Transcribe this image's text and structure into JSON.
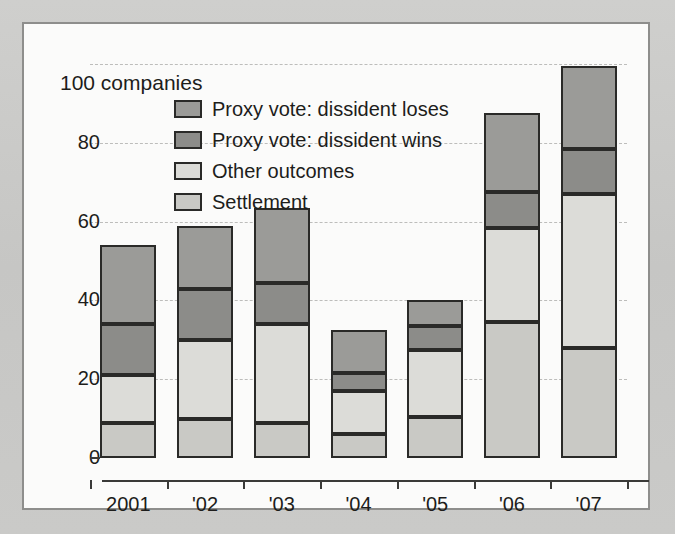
{
  "chart_data": {
    "type": "bar",
    "stacked": true,
    "title": "",
    "subtitle": "",
    "unit_label": "100 companies",
    "xlabel": "",
    "ylabel": "",
    "ylim": [
      0,
      100
    ],
    "yticks": [
      0,
      20,
      40,
      60,
      80,
      100
    ],
    "ytick_labels": [
      "0",
      "20",
      "40",
      "60",
      "80",
      "100"
    ],
    "grid": true,
    "legend_position": "top-center",
    "categories": [
      "2001",
      "'02",
      "'03",
      "'04",
      "'05",
      "'06",
      "'07"
    ],
    "series": [
      {
        "name": "Settlement",
        "color": "#c9c9c5",
        "values": [
          9,
          10,
          9,
          6,
          10.5,
          34.5,
          28
        ]
      },
      {
        "name": "Other outcomes",
        "color": "#dcdcd8",
        "values": [
          12,
          20,
          25,
          11,
          17,
          24,
          39
        ]
      },
      {
        "name": "Proxy vote: dissident wins",
        "color": "#8c8c89",
        "values": [
          13,
          13,
          10.5,
          4.5,
          6,
          9,
          11.5
        ]
      },
      {
        "name": "Proxy vote: dissident loses",
        "color": "#9b9b98",
        "values": [
          20,
          16,
          19,
          11,
          6.5,
          20,
          21
        ]
      }
    ],
    "totals": [
      54,
      59,
      64,
      32,
      40,
      88,
      100
    ],
    "legend_order": [
      "Proxy vote: dissident loses",
      "Proxy vote: dissident wins",
      "Other outcomes",
      "Settlement"
    ]
  },
  "legend": {
    "items": [
      {
        "label": "Proxy vote: dissident loses",
        "swatch_class": "fill-loses",
        "color": "#9b9b98"
      },
      {
        "label": "Proxy vote: dissident wins",
        "swatch_class": "fill-wins",
        "color": "#8c8c89"
      },
      {
        "label": "Other outcomes",
        "swatch_class": "fill-other",
        "color": "#dcdcd8"
      },
      {
        "label": "Settlement",
        "swatch_class": "fill-settle",
        "color": "#c9c9c5"
      }
    ]
  },
  "colors": {
    "background": "#c9c9c7",
    "card": "#fbfbfa",
    "frame": "#8e8e8c",
    "axis": "#3a3a38",
    "grid": "#bdbdbb",
    "text": "#1d1d1b"
  }
}
